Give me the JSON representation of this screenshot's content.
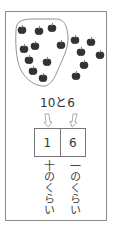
{
  "illustration": {
    "object": "apple",
    "group_count": 10,
    "extra_count": 6,
    "colors": {
      "apple": "#333333",
      "outline": "#777777"
    }
  },
  "header": {
    "text": "10と6"
  },
  "place_value_table": {
    "cells": [
      {
        "value": "1",
        "label": "十のくらい"
      },
      {
        "value": "6",
        "label": "一のくらい"
      }
    ]
  }
}
